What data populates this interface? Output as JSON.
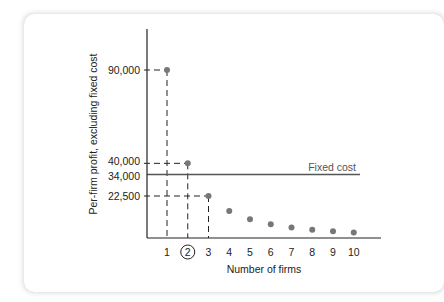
{
  "chart_data": {
    "type": "scatter",
    "title": "",
    "xlabel": "Number of firms",
    "ylabel": "Per-firm profit, excluding fixed cost",
    "x": [
      1,
      2,
      3,
      4,
      5,
      6,
      7,
      8,
      9,
      10
    ],
    "values": [
      90000,
      40000,
      22500,
      14400,
      10000,
      7347,
      5625,
      4444,
      3600,
      2975
    ],
    "x_tick_labels": [
      "1",
      "2",
      "3",
      "4",
      "5",
      "6",
      "7",
      "8",
      "9",
      "10"
    ],
    "highlighted_x": 2,
    "y_tick_labels": [
      "90,000",
      "40,000",
      "34,000",
      "22,500"
    ],
    "y_tick_values": [
      90000,
      40000,
      34000,
      22500
    ],
    "reference_line": {
      "label": "Fixed cost",
      "value": 34000
    },
    "dashed_guides": [
      1,
      2,
      3
    ],
    "ylim": [
      0,
      110000
    ],
    "xlim": [
      0,
      11
    ],
    "grid": false,
    "legend": "none",
    "colors": {
      "points": "#777777",
      "fixed_cost_line": "#555555",
      "axis": "#222222"
    }
  }
}
